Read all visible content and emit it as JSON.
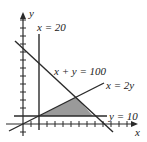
{
  "diagram": {
    "type": "linear-programming-feasible-region",
    "axes": {
      "x_label": "x",
      "y_label": "y"
    },
    "lines": [
      {
        "id": "x20",
        "label": "x = 20"
      },
      {
        "id": "sum100",
        "label": "x + y = 100"
      },
      {
        "id": "x2y",
        "label": "x = 2y"
      },
      {
        "id": "y10",
        "label": "y = 10"
      }
    ],
    "feasible_region": {
      "vertices": [
        [
          20,
          10
        ],
        [
          90,
          10
        ],
        [
          66.7,
          33.3
        ]
      ],
      "fill": "#9a9a9a"
    },
    "colors": {
      "line": "#2a2a2a",
      "region": "#9a9a9a"
    }
  }
}
